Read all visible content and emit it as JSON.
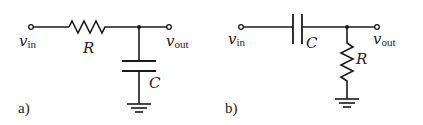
{
  "circuits": [
    {
      "id": "a",
      "tag": "a)",
      "type": "RC low-pass filter",
      "input": {
        "symbol": "v",
        "subscript": "in"
      },
      "output": {
        "symbol": "v",
        "subscript": "out"
      },
      "series_element": {
        "kind": "resistor",
        "label": "R"
      },
      "shunt_element": {
        "kind": "capacitor",
        "label": "C"
      },
      "shunt_to": "ground"
    },
    {
      "id": "b",
      "tag": "b)",
      "type": "RC high-pass filter",
      "input": {
        "symbol": "v",
        "subscript": "in"
      },
      "output": {
        "symbol": "v",
        "subscript": "out"
      },
      "series_element": {
        "kind": "capacitor",
        "label": "C"
      },
      "shunt_element": {
        "kind": "resistor",
        "label": "R"
      },
      "shunt_to": "ground"
    }
  ],
  "colors": {
    "stroke": "#1a1a1a",
    "background": "#ffffff"
  }
}
